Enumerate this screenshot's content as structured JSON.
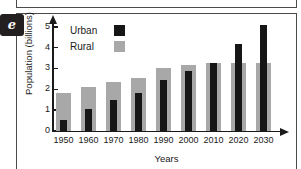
{
  "panel": {
    "letter": "e"
  },
  "chart_data": {
    "type": "bar",
    "title": "",
    "xlabel": "Years",
    "ylabel": "Population (billions)",
    "categories": [
      "1950",
      "1960",
      "1970",
      "1980",
      "1990",
      "2000",
      "2010",
      "2020",
      "2030"
    ],
    "series": [
      {
        "name": "Urban",
        "color": "#161616",
        "values": [
          0.55,
          1.05,
          1.5,
          1.85,
          2.45,
          2.9,
          3.3,
          4.2,
          5.1
        ]
      },
      {
        "name": "Rural",
        "color": "#a8a8a8",
        "values": [
          1.85,
          2.1,
          2.35,
          2.55,
          3.05,
          3.2,
          3.3,
          3.3,
          3.3
        ]
      }
    ],
    "ylim": [
      0,
      5
    ],
    "yticks": [
      0,
      1,
      2,
      3,
      4,
      5
    ],
    "ytick_labels": [
      "0",
      "1",
      "2",
      "3",
      "4",
      "5"
    ],
    "grid": false,
    "legend_position": "top-left",
    "legend": [
      "Urban",
      "Rural"
    ]
  }
}
